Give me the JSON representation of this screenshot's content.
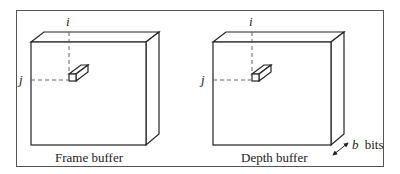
{
  "diagram": {
    "colors": {
      "line": "#222222",
      "frame": "#555555",
      "background": "#ffffff"
    },
    "left_buffer": {
      "label": "Frame buffer",
      "column_index_label": "i",
      "row_index_label": "j"
    },
    "right_buffer": {
      "label": "Depth buffer",
      "column_index_label": "i",
      "row_index_label": "j",
      "depth_label": "b bits",
      "depth_symbol": "b",
      "depth_unit": "bits"
    }
  }
}
